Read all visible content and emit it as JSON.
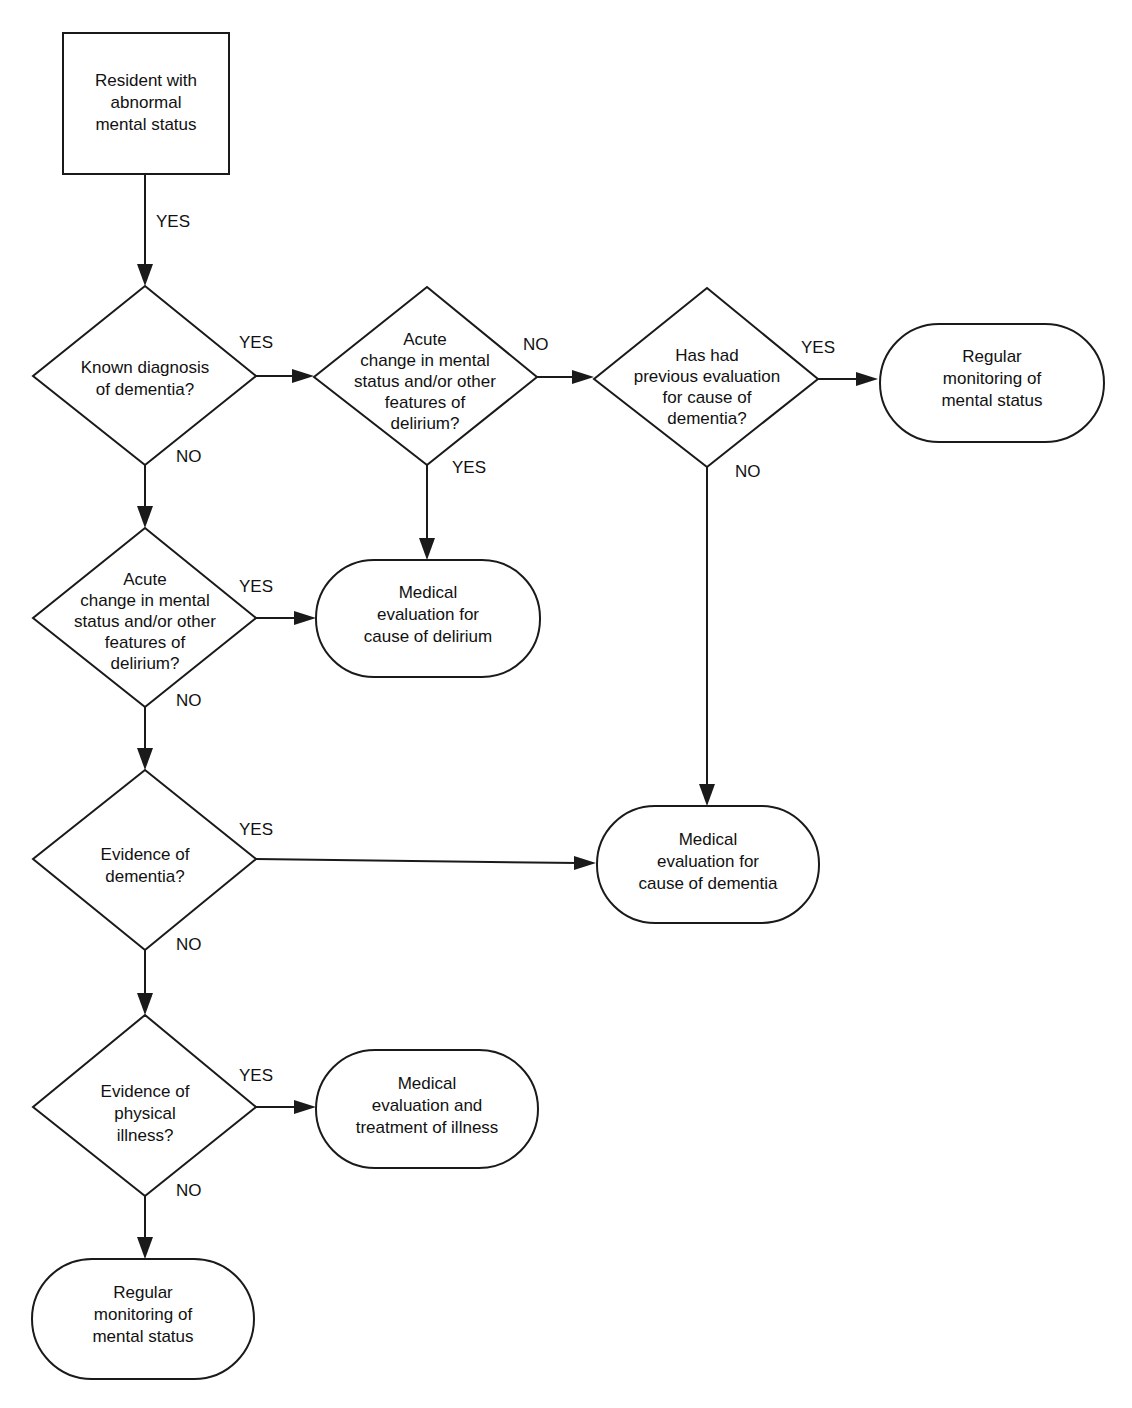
{
  "colors": {
    "stroke": "#1a1a1a",
    "text": "#111111",
    "background": "#ffffff"
  },
  "nodes": {
    "start": {
      "lines": [
        "Resident with",
        "abnormal",
        "mental status"
      ]
    },
    "known_dementia": {
      "lines": [
        "Known diagnosis",
        "of dementia?"
      ]
    },
    "acute_change_top": {
      "lines": [
        "Acute",
        "change in mental",
        "status and/or other",
        "features of",
        "delirium?"
      ]
    },
    "prev_eval": {
      "lines": [
        "Has had",
        "previous evaluation",
        "for cause of",
        "dementia?"
      ]
    },
    "regular_monitoring_top": {
      "lines": [
        "Regular",
        "monitoring of",
        "mental status"
      ]
    },
    "acute_change_left": {
      "lines": [
        "Acute",
        "change in mental",
        "status and/or other",
        "features of",
        "delirium?"
      ]
    },
    "eval_delirium": {
      "lines": [
        "Medical",
        "evaluation for",
        "cause of delirium"
      ]
    },
    "evidence_dementia": {
      "lines": [
        "Evidence of",
        "dementia?"
      ]
    },
    "eval_dementia": {
      "lines": [
        "Medical",
        "evaluation for",
        "cause of dementia"
      ]
    },
    "evidence_illness": {
      "lines": [
        "Evidence of",
        "physical",
        "illness?"
      ]
    },
    "eval_illness": {
      "lines": [
        "Medical",
        "evaluation and",
        "treatment of illness"
      ]
    },
    "regular_monitoring_bottom": {
      "lines": [
        "Regular",
        "monitoring of",
        "mental status"
      ]
    }
  },
  "edge_labels": {
    "start_to_known": "YES",
    "known_yes": "YES",
    "known_no": "NO",
    "acute_top_no": "NO",
    "acute_top_yes": "YES",
    "prev_yes": "YES",
    "prev_no": "NO",
    "acute_left_yes": "YES",
    "acute_left_no": "NO",
    "evidence_dementia_yes": "YES",
    "evidence_dementia_no": "NO",
    "evidence_illness_yes": "YES",
    "evidence_illness_no": "NO"
  }
}
